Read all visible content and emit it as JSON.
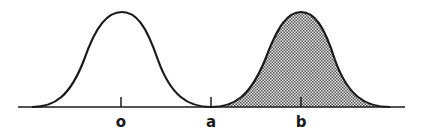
{
  "diagram": {
    "title": "",
    "axis": {
      "x_start": 18,
      "x_end": 405,
      "y": 107
    },
    "ticks": [
      {
        "label": "o",
        "x": 121
      },
      {
        "label": "a",
        "x": 211
      },
      {
        "label": "b",
        "x": 301
      }
    ],
    "curves": [
      {
        "name": "distribution-o",
        "center_label": "o",
        "shaded": false
      },
      {
        "name": "distribution-b",
        "center_label": "b",
        "shaded": true,
        "shade_start_label": "a"
      }
    ],
    "colors": {
      "stroke": "#1a1a1a",
      "shade": "#b0b0b0"
    }
  }
}
